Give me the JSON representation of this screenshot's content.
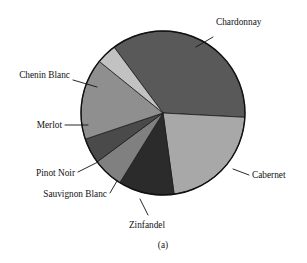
{
  "figure": {
    "caption": "(a)",
    "background": "#ffffff",
    "outline_color": "#111111"
  },
  "chart_data": {
    "type": "pie",
    "title": "",
    "xlabel": "",
    "ylabel": "",
    "grid": false,
    "legend_position": "none",
    "labels_placement": "leader-lines-outside",
    "center": [
      163,
      113
    ],
    "radius": 82,
    "start_angle_deg": -3,
    "direction": "clockwise",
    "categories": [
      "Chardonnay",
      "Cabernet",
      "Zinfandel",
      "Sauvignon Blanc",
      "Pinot Noir",
      "Merlot",
      "Chenin Blanc"
    ],
    "values": [
      36,
      22,
      11,
      6,
      5,
      16,
      4
    ],
    "colors": [
      "#595959",
      "#a8a8a8",
      "#2b2b2b",
      "#808080",
      "#4a4a4a",
      "#8f8f8f",
      "#c2c2c2"
    ],
    "slices": [
      {
        "label": "Chardonnay",
        "value": 36,
        "color": "#595959",
        "start_deg": -3,
        "end_deg": 126.6
      },
      {
        "label": "Cabernet",
        "value": 22,
        "color": "#a8a8a8",
        "start_deg": -82.2,
        "end_deg": -3
      },
      {
        "label": "Zinfandel",
        "value": 11,
        "color": "#2b2b2b",
        "start_deg": -121.8,
        "end_deg": -82.2
      },
      {
        "label": "Sauvignon Blanc",
        "value": 6,
        "color": "#808080",
        "start_deg": -143.4,
        "end_deg": -121.8
      },
      {
        "label": "Pinot Noir",
        "value": 5,
        "color": "#4a4a4a",
        "start_deg": -161.4,
        "end_deg": -143.4
      },
      {
        "label": "Merlot",
        "value": 16,
        "color": "#8f8f8f",
        "start_deg": -219,
        "end_deg": -161.4
      },
      {
        "label": "Chenin Blanc",
        "value": 4,
        "color": "#c2c2c2",
        "start_deg": -233.4,
        "end_deg": -219
      }
    ]
  },
  "labels": {
    "chardonnay": "Chardonnay",
    "cabernet": "Cabernet",
    "zinfandel": "Zinfandel",
    "sauvignon_blanc": "Sauvignon Blanc",
    "pinot_noir": "Pinot Noir",
    "merlot": "Merlot",
    "chenin_blanc": "Chenin Blanc"
  }
}
